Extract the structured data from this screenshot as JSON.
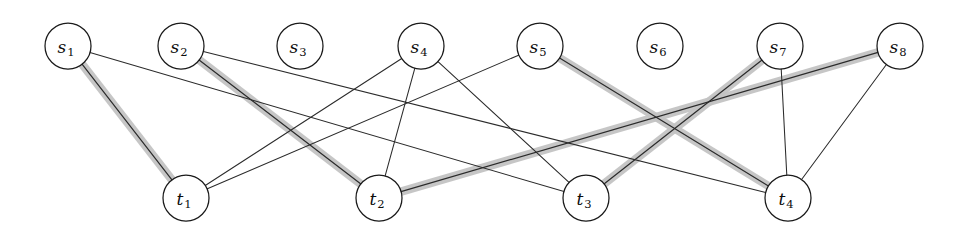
{
  "figure": {
    "kind": "bipartite-graph",
    "title": "",
    "background_color": "#ffffff",
    "width": 960,
    "height": 242
  },
  "style": {
    "node_fill": "#ffffff",
    "node_stroke": "#1a1a1a",
    "edge_color": "#2b2b2b",
    "highlight_color": "#c3c3c3",
    "node_radius": 23,
    "label_color": "#0d0d0d"
  },
  "nodes": {
    "source_row": [
      {
        "id": "s1",
        "base": "s",
        "sub": "1",
        "label": "s1",
        "x": 68,
        "y": 46
      },
      {
        "id": "s2",
        "base": "s",
        "sub": "2",
        "label": "s2",
        "x": 181,
        "y": 46
      },
      {
        "id": "s3",
        "base": "s",
        "sub": "3",
        "label": "s3",
        "x": 300,
        "y": 46
      },
      {
        "id": "s4",
        "base": "s",
        "sub": "4",
        "label": "s4",
        "x": 421,
        "y": 46
      },
      {
        "id": "s5",
        "base": "s",
        "sub": "5",
        "label": "s5",
        "x": 540,
        "y": 46
      },
      {
        "id": "s6",
        "base": "s",
        "sub": "6",
        "label": "s6",
        "x": 660,
        "y": 46
      },
      {
        "id": "s7",
        "base": "s",
        "sub": "7",
        "label": "s7",
        "x": 780,
        "y": 46
      },
      {
        "id": "s8",
        "base": "s",
        "sub": "8",
        "label": "s8",
        "x": 900,
        "y": 46
      }
    ],
    "sink_row": [
      {
        "id": "t1",
        "base": "t",
        "sub": "1",
        "label": "t1",
        "x": 186,
        "y": 198
      },
      {
        "id": "t2",
        "base": "t",
        "sub": "2",
        "label": "t2",
        "x": 379,
        "y": 198
      },
      {
        "id": "t3",
        "base": "t",
        "sub": "3",
        "label": "t3",
        "x": 586,
        "y": 198
      },
      {
        "id": "t4",
        "base": "t",
        "sub": "4",
        "label": "t4",
        "x": 788,
        "y": 198
      }
    ]
  },
  "edges": [
    {
      "from": "s1",
      "to": "t1",
      "highlighted": true
    },
    {
      "from": "s1",
      "to": "t3",
      "highlighted": false
    },
    {
      "from": "s2",
      "to": "t2",
      "highlighted": true
    },
    {
      "from": "s2",
      "to": "t4",
      "highlighted": false
    },
    {
      "from": "s4",
      "to": "t1",
      "highlighted": false
    },
    {
      "from": "s4",
      "to": "t2",
      "highlighted": false
    },
    {
      "from": "s4",
      "to": "t3",
      "highlighted": false
    },
    {
      "from": "s5",
      "to": "t1",
      "highlighted": false
    },
    {
      "from": "s5",
      "to": "t4",
      "highlighted": true
    },
    {
      "from": "s7",
      "to": "t3",
      "highlighted": true
    },
    {
      "from": "s7",
      "to": "t4",
      "highlighted": false
    },
    {
      "from": "s8",
      "to": "t2",
      "highlighted": true
    },
    {
      "from": "s8",
      "to": "t4",
      "highlighted": false
    }
  ],
  "isolated_nodes": [
    "s3",
    "s6"
  ]
}
